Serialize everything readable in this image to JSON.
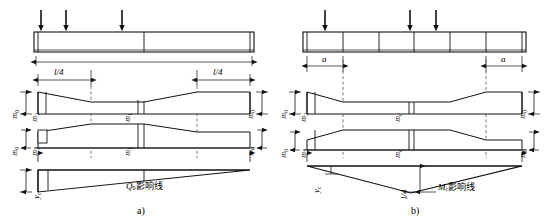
{
  "figure": {
    "width": 545,
    "height": 222,
    "background": "#ffffff",
    "line_color": "#1a1a1a",
    "dashed_color": "#555555"
  },
  "panels": [
    {
      "id": "a",
      "caption": "a)",
      "title_label": "Q₀影响线",
      "influence_symbol": "Q",
      "influence_subscript": "0",
      "influence_suffix": "影响线",
      "load_arrows": 3,
      "dimensions": [
        {
          "label": "l/4",
          "symbol": "l",
          "divisor": "4",
          "position": "left"
        },
        {
          "label": "l/4",
          "symbol": "l",
          "divisor": "4",
          "position": "right"
        }
      ],
      "ordinate_labels": [
        {
          "text": "m₀",
          "symbol": "m",
          "sub": "0",
          "where": "outer-left-upper"
        },
        {
          "text": "m₂",
          "symbol": "m",
          "sub": "2",
          "where": "inner-left-upper"
        },
        {
          "text": "m₁",
          "symbol": "m",
          "sub": "1",
          "where": "center-upper"
        },
        {
          "text": "m₀",
          "symbol": "m",
          "sub": "0",
          "where": "outer-right-upper"
        },
        {
          "text": "m₀",
          "symbol": "m",
          "sub": "0",
          "where": "outer-left-lower"
        },
        {
          "text": "m₂",
          "symbol": "m",
          "sub": "2",
          "where": "inner-left-lower"
        },
        {
          "text": "m₁",
          "symbol": "m",
          "sub": "1",
          "where": "center-lower"
        },
        {
          "text": "m₀",
          "symbol": "m",
          "sub": "0",
          "where": "outer-right-lower"
        }
      ],
      "ordinate_y": {
        "text": "y_c",
        "symbol": "y",
        "sub": "c"
      }
    },
    {
      "id": "b",
      "caption": "b)",
      "title_label": "M_c影响线",
      "influence_symbol": "M",
      "influence_subscript": "c",
      "influence_suffix": "影响线",
      "load_arrows": 3,
      "dimensions": [
        {
          "label": "a",
          "symbol": "a",
          "divisor": "",
          "position": "left"
        },
        {
          "label": "a",
          "symbol": "a",
          "divisor": "",
          "position": "right"
        }
      ],
      "peak_label": {
        "text": "l/4",
        "symbol": "l",
        "divisor": "4"
      },
      "ordinate_labels": [
        {
          "text": "m₀",
          "symbol": "m",
          "sub": "0",
          "where": "outer-left-upper"
        },
        {
          "text": "m₂",
          "symbol": "m",
          "sub": "2",
          "where": "inner-left-upper"
        },
        {
          "text": "m₁",
          "symbol": "m",
          "sub": "c",
          "where": "center-upper"
        },
        {
          "text": "m₀",
          "symbol": "m",
          "sub": "0",
          "where": "outer-right-upper"
        },
        {
          "text": "m₀",
          "symbol": "m",
          "sub": "0",
          "where": "outer-left-lower"
        },
        {
          "text": "m₂",
          "symbol": "m",
          "sub": "2",
          "where": "inner-left-lower"
        },
        {
          "text": "m₁",
          "symbol": "m",
          "sub": "c",
          "where": "center-lower"
        },
        {
          "text": "m₀",
          "symbol": "m",
          "sub": "0",
          "where": "outer-right-lower"
        }
      ],
      "ordinate_y": {
        "text": "y_c",
        "symbol": "y",
        "sub": "c"
      }
    }
  ],
  "text": {
    "panel_a_caption": "a)",
    "panel_b_caption": "b)",
    "influence_line_cjk": "影响线",
    "sym_Q": "Q",
    "sym_M": "M",
    "sym_m": "m",
    "sym_y": "y",
    "sym_l": "l",
    "sym_a": "a",
    "sub_0": "0",
    "sub_1": "1",
    "sub_2": "2",
    "sub_c": "c",
    "frac_l_over_4": "l/4"
  }
}
